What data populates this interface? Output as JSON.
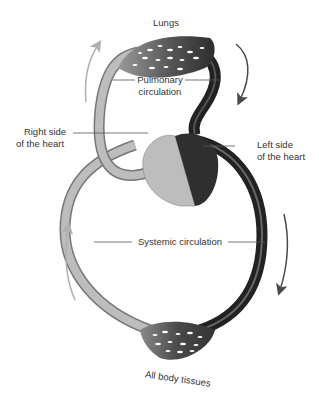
{
  "diagram": {
    "labels": {
      "lungs": "Lungs",
      "pulmonary_1": "Pulmonary",
      "pulmonary_2": "circulation",
      "right_heart_1": "Right side",
      "right_heart_2": "of the heart",
      "left_heart_1": "Left side",
      "left_heart_2": "of the heart",
      "systemic": "Systemic circulation",
      "tissues": "All body tissues"
    },
    "colors": {
      "deoxygenated": "#b5b5b5",
      "oxygenated": "#3a3a3a",
      "arrow_light": "#b0b0b0",
      "arrow_dark": "#4a4a4a",
      "leader": "#555555"
    }
  }
}
